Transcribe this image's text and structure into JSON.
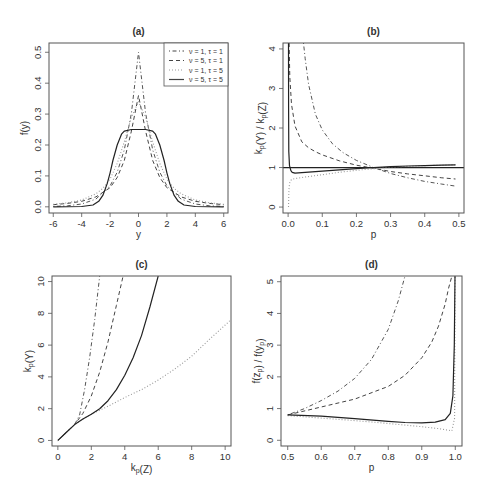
{
  "figure": {
    "width": 489,
    "height": 489
  },
  "chart_data": [
    {
      "id": "a",
      "type": "line",
      "title": "(a)",
      "xlabel": "y",
      "ylabel": "f(y)",
      "xlim": [
        -6.3,
        6.3
      ],
      "ylim": [
        -0.02,
        0.53
      ],
      "xticks": [
        -6,
        -4,
        -2,
        0,
        2,
        4,
        6
      ],
      "xtick_labels": [
        "-6",
        "-4",
        "-2",
        "0",
        "2",
        "4",
        "6"
      ],
      "yticks": [
        0.0,
        0.1,
        0.2,
        0.3,
        0.4,
        0.5
      ],
      "ytick_labels": [
        "0.0",
        "0.1",
        "0.2",
        "0.3",
        "0.4",
        "0.5"
      ],
      "grid": false,
      "legend_position": "top-right",
      "box": [
        49,
        43,
        228,
        213
      ],
      "series": [
        {
          "name": "ν = 1, τ = 1",
          "style": "dotdash",
          "color": "#555555",
          "x": [
            -6,
            -5,
            -4,
            -3,
            -2,
            -1.5,
            -1,
            -0.5,
            0,
            0.5,
            1,
            1.5,
            2,
            3,
            4,
            5,
            6
          ],
          "y": [
            0.0012,
            0.0034,
            0.0092,
            0.025,
            0.068,
            0.112,
            0.184,
            0.303,
            0.5,
            0.303,
            0.184,
            0.112,
            0.068,
            0.025,
            0.0092,
            0.0034,
            0.0012
          ]
        },
        {
          "name": "ν = 5, τ = 1",
          "style": "dashed",
          "color": "#444444",
          "x": [
            -6,
            -5,
            -4,
            -3,
            -2,
            -1.5,
            -1,
            -0.5,
            0,
            0.5,
            1,
            1.5,
            2,
            3,
            4,
            5,
            6
          ],
          "y": [
            0.007,
            0.011,
            0.018,
            0.032,
            0.062,
            0.095,
            0.15,
            0.245,
            0.36,
            0.245,
            0.15,
            0.095,
            0.062,
            0.032,
            0.018,
            0.011,
            0.007
          ]
        },
        {
          "name": "ν = 1, τ = 5",
          "style": "dotted",
          "color": "#999999",
          "x": [
            -6,
            -5,
            -4,
            -3,
            -2.5,
            -2,
            -1.5,
            -1,
            -0.5,
            0,
            0.5,
            1,
            1.5,
            2,
            2.5,
            3,
            4,
            5,
            6
          ],
          "y": [
            0.008,
            0.013,
            0.022,
            0.042,
            0.06,
            0.09,
            0.14,
            0.21,
            0.29,
            0.34,
            0.29,
            0.21,
            0.14,
            0.09,
            0.06,
            0.042,
            0.022,
            0.013,
            0.008
          ]
        },
        {
          "name": "ν = 5, τ = 5",
          "style": "solid",
          "color": "#222222",
          "x": [
            -6,
            -4,
            -3.2,
            -2.8,
            -2.5,
            -2.2,
            -2,
            -1.8,
            -1.5,
            -1.2,
            -1,
            -0.5,
            0,
            0.5,
            1,
            1.2,
            1.5,
            1.8,
            2,
            2.2,
            2.5,
            2.8,
            3.2,
            4,
            6
          ],
          "y": [
            0.0,
            0.001,
            0.006,
            0.018,
            0.038,
            0.075,
            0.11,
            0.15,
            0.2,
            0.235,
            0.245,
            0.25,
            0.25,
            0.25,
            0.245,
            0.235,
            0.2,
            0.15,
            0.11,
            0.075,
            0.038,
            0.018,
            0.006,
            0.001,
            0.0
          ]
        }
      ]
    },
    {
      "id": "b",
      "type": "line",
      "title": "(b)",
      "xlabel": "p",
      "ylabel": "k_p(Y) / k_p(Z)",
      "xlim": [
        -0.015,
        0.515
      ],
      "ylim": [
        -0.15,
        4.15
      ],
      "xticks": [
        0.0,
        0.1,
        0.2,
        0.3,
        0.4,
        0.5
      ],
      "xtick_labels": [
        "0.0",
        "0.1",
        "0.2",
        "0.3",
        "0.4",
        "0.5"
      ],
      "yticks": [
        0,
        1,
        2,
        3,
        4
      ],
      "ytick_labels": [
        "0",
        "1",
        "2",
        "3",
        "4"
      ],
      "hline": 1,
      "grid": false,
      "box": [
        283,
        43,
        464,
        213
      ],
      "series": [
        {
          "name": "ν = 1, τ = 1",
          "style": "dotdash",
          "color": "#555555",
          "x": [
            0.045,
            0.05,
            0.06,
            0.08,
            0.1,
            0.13,
            0.16,
            0.2,
            0.25,
            0.3,
            0.35,
            0.4,
            0.45,
            0.49
          ],
          "y": [
            4.15,
            3.75,
            3.1,
            2.35,
            1.95,
            1.6,
            1.38,
            1.18,
            1.0,
            0.85,
            0.74,
            0.65,
            0.58,
            0.53
          ]
        },
        {
          "name": "ν = 5, τ = 1",
          "style": "dashed",
          "color": "#444444",
          "x": [
            0.003,
            0.005,
            0.01,
            0.02,
            0.04,
            0.06,
            0.08,
            0.1,
            0.15,
            0.2,
            0.25,
            0.3,
            0.35,
            0.4,
            0.45,
            0.49
          ],
          "y": [
            4.15,
            3.3,
            2.6,
            2.05,
            1.65,
            1.5,
            1.4,
            1.32,
            1.17,
            1.06,
            0.98,
            0.9,
            0.84,
            0.79,
            0.74,
            0.71
          ]
        },
        {
          "name": "ν = 1, τ = 5",
          "style": "dotted",
          "color": "#999999",
          "x": [
            0.001,
            0.002,
            0.003,
            0.005,
            0.01,
            0.02,
            0.05,
            0.1,
            0.15,
            0.2,
            0.25,
            0.3,
            0.35,
            0.4,
            0.45,
            0.49
          ],
          "y": [
            0.0,
            0.3,
            0.5,
            0.62,
            0.7,
            0.72,
            0.76,
            0.82,
            0.88,
            0.93,
            0.97,
            1.01,
            1.03,
            1.05,
            1.06,
            1.07
          ]
        },
        {
          "name": "ν = 5, τ = 5",
          "style": "solid",
          "color": "#222222",
          "x": [
            0.001,
            0.0015,
            0.002,
            0.004,
            0.008,
            0.012,
            0.02,
            0.04,
            0.1,
            0.15,
            0.2,
            0.25,
            0.3,
            0.35,
            0.4,
            0.45,
            0.49
          ],
          "y": [
            4.15,
            2.5,
            1.4,
            1.05,
            0.92,
            0.88,
            0.86,
            0.87,
            0.91,
            0.94,
            0.97,
            1.0,
            1.02,
            1.04,
            1.05,
            1.06,
            1.07
          ]
        }
      ]
    },
    {
      "id": "c",
      "type": "line",
      "title": "(c)",
      "xlabel": "k_p(Z)",
      "ylabel": "k_p(Y)",
      "xlim": [
        -0.35,
        10.35
      ],
      "ylim": [
        -0.35,
        10.35
      ],
      "xticks": [
        0,
        2,
        4,
        6,
        8,
        10
      ],
      "xtick_labels": [
        "0",
        "2",
        "4",
        "6",
        "8",
        "10"
      ],
      "yticks": [
        0,
        2,
        4,
        6,
        8,
        10
      ],
      "ytick_labels": [
        "0",
        "2",
        "4",
        "6",
        "8",
        "10"
      ],
      "grid": false,
      "box": [
        52,
        276,
        231,
        446
      ],
      "series": [
        {
          "name": "ν = 1, τ = 1",
          "style": "dotdash",
          "color": "#555555",
          "x": [
            0,
            0.5,
            1.0,
            1.3,
            1.6,
            1.9,
            2.2,
            2.5
          ],
          "y": [
            0,
            0.5,
            1.0,
            1.6,
            3.2,
            5.2,
            7.6,
            10.35
          ]
        },
        {
          "name": "ν = 5, τ = 1",
          "style": "dashed",
          "color": "#444444",
          "x": [
            0,
            0.5,
            1.0,
            1.5,
            2.0,
            2.5,
            3.0,
            3.5,
            3.9
          ],
          "y": [
            0,
            0.5,
            1.0,
            1.7,
            2.8,
            4.3,
            6.2,
            8.5,
            10.35
          ]
        },
        {
          "name": "ν = 1, τ = 5",
          "style": "dotted",
          "color": "#999999",
          "x": [
            0,
            0.5,
            1.0,
            1.5,
            2.0,
            3.0,
            4.0,
            5.0,
            6.0,
            7.0,
            8.0,
            9.0,
            10.35
          ],
          "y": [
            0,
            0.5,
            1.0,
            1.35,
            1.65,
            2.15,
            2.7,
            3.2,
            3.8,
            4.5,
            5.3,
            6.3,
            7.6
          ]
        },
        {
          "name": "ν = 5, τ = 5",
          "style": "solid",
          "color": "#222222",
          "x": [
            0,
            0.5,
            1.0,
            1.5,
            2.0,
            2.5,
            3.0,
            3.5,
            4.0,
            4.5,
            5.0,
            5.5,
            6.0
          ],
          "y": [
            0,
            0.5,
            1.0,
            1.35,
            1.65,
            2.0,
            2.5,
            3.2,
            4.1,
            5.2,
            6.6,
            8.4,
            10.35
          ]
        }
      ]
    },
    {
      "id": "d",
      "type": "line",
      "title": "(d)",
      "xlabel": "p",
      "ylabel": "f(z_p) / f(y_p)",
      "xlim": [
        0.48,
        1.02
      ],
      "ylim": [
        -0.18,
        5.18
      ],
      "xticks": [
        0.5,
        0.6,
        0.7,
        0.8,
        0.9,
        1.0
      ],
      "xtick_labels": [
        "0.5",
        "0.6",
        "0.7",
        "0.8",
        "0.9",
        "1.0"
      ],
      "yticks": [
        0,
        1,
        2,
        3,
        4,
        5
      ],
      "ytick_labels": [
        "0",
        "1",
        "2",
        "3",
        "4",
        "5"
      ],
      "grid": false,
      "box": [
        281,
        276,
        462,
        446
      ],
      "series": [
        {
          "name": "ν = 1, τ = 1",
          "style": "dotdash",
          "color": "#555555",
          "x": [
            0.5,
            0.55,
            0.6,
            0.65,
            0.7,
            0.75,
            0.8,
            0.83,
            0.85
          ],
          "y": [
            0.8,
            1.0,
            1.25,
            1.55,
            1.95,
            2.55,
            3.5,
            4.4,
            5.18
          ]
        },
        {
          "name": "ν = 5, τ = 1",
          "style": "dashed",
          "color": "#444444",
          "x": [
            0.5,
            0.6,
            0.7,
            0.8,
            0.85,
            0.9,
            0.93,
            0.95,
            0.97,
            0.98,
            0.99
          ],
          "y": [
            0.8,
            1.05,
            1.3,
            1.7,
            2.05,
            2.6,
            3.1,
            3.6,
            4.3,
            4.8,
            5.18
          ]
        },
        {
          "name": "ν = 1, τ = 5",
          "style": "dotted",
          "color": "#999999",
          "x": [
            0.5,
            0.6,
            0.7,
            0.8,
            0.9,
            0.95,
            0.99,
            0.998,
            0.999
          ],
          "y": [
            0.78,
            0.7,
            0.62,
            0.53,
            0.43,
            0.37,
            0.3,
            0.7,
            5.18
          ]
        },
        {
          "name": "ν = 5, τ = 5",
          "style": "solid",
          "color": "#222222",
          "x": [
            0.5,
            0.6,
            0.7,
            0.8,
            0.85,
            0.9,
            0.94,
            0.97,
            0.985,
            0.993,
            0.997,
            0.999
          ],
          "y": [
            0.8,
            0.76,
            0.68,
            0.6,
            0.56,
            0.55,
            0.57,
            0.65,
            0.85,
            1.4,
            3.0,
            5.18
          ]
        }
      ]
    }
  ],
  "legend": {
    "entries": [
      {
        "label": "ν = 1, τ = 1",
        "style": "dotdash"
      },
      {
        "label": "ν = 5, τ = 1",
        "style": "dashed"
      },
      {
        "label": "ν = 1, τ = 5",
        "style": "dotted"
      },
      {
        "label": "ν = 5, τ = 5",
        "style": "solid"
      }
    ]
  },
  "colors": {
    "axis": "#555555",
    "text": "#333333",
    "background": "#ffffff"
  }
}
